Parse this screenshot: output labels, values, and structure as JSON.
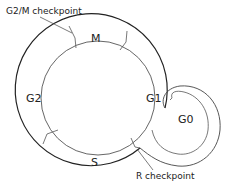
{
  "diagram": {
    "phases": [
      {
        "id": "M",
        "label": "M"
      },
      {
        "id": "G1",
        "label": "G1"
      },
      {
        "id": "S",
        "label": "S"
      },
      {
        "id": "G2",
        "label": "G2"
      },
      {
        "id": "G0",
        "label": "G0"
      }
    ],
    "checkpoints": [
      {
        "id": "g2m",
        "label": "G2/M checkpoint"
      },
      {
        "id": "r",
        "label": "R checkpoint"
      }
    ],
    "colors": {
      "line": "#333333",
      "outer_line": "#222222",
      "text": "#222222",
      "background": "#ffffff"
    }
  }
}
